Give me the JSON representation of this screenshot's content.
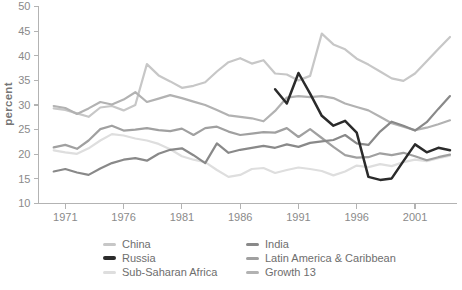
{
  "chart_data": {
    "type": "line",
    "title": "",
    "xlabel": "",
    "ylabel": "percent",
    "grid": false,
    "xlim": [
      1968.7,
      2004.6
    ],
    "ylim": [
      10,
      50
    ],
    "x_ticks": [
      1971,
      1976,
      1981,
      1986,
      1991,
      1996,
      2001
    ],
    "y_ticks": [
      10,
      15,
      20,
      25,
      30,
      35,
      40,
      45,
      50
    ],
    "years": [
      1970,
      1971,
      1972,
      1973,
      1974,
      1975,
      1976,
      1977,
      1978,
      1979,
      1980,
      1981,
      1982,
      1983,
      1984,
      1985,
      1986,
      1987,
      1988,
      1989,
      1990,
      1991,
      1992,
      1993,
      1994,
      1995,
      1996,
      1997,
      1998,
      1999,
      2000,
      2001,
      2002,
      2003,
      2004
    ],
    "series": [
      {
        "name": "Sub-Saharan Africa",
        "color": "#dedede",
        "values": [
          20.8,
          20.4,
          20.1,
          21.2,
          22.8,
          24.1,
          23.8,
          23.2,
          22.8,
          22.1,
          21.0,
          19.6,
          18.9,
          18.4,
          16.8,
          15.4,
          15.8,
          17.0,
          17.2,
          16.2,
          16.8,
          17.3,
          17.0,
          16.6,
          15.7,
          16.5,
          17.7,
          17.4,
          18.0,
          17.6,
          18.4,
          18.9,
          18.6,
          19.2,
          19.7
        ]
      },
      {
        "name": "China",
        "color": "#c7c7c7",
        "values": [
          29.3,
          29.0,
          28.3,
          27.6,
          29.5,
          29.8,
          28.9,
          30.0,
          38.3,
          36.0,
          34.8,
          33.5,
          33.9,
          34.6,
          36.8,
          38.7,
          39.5,
          38.4,
          39.1,
          36.4,
          36.2,
          35.0,
          35.9,
          44.5,
          42.3,
          41.3,
          39.4,
          38.2,
          36.8,
          35.4,
          34.9,
          36.4,
          38.9,
          41.4,
          43.8
        ]
      },
      {
        "name": "Growth 13",
        "color": "#b2b2b2",
        "values": [
          29.8,
          29.4,
          28.2,
          29.3,
          30.6,
          30.1,
          31.1,
          32.6,
          30.6,
          31.3,
          32.0,
          31.4,
          30.7,
          30.0,
          29.0,
          27.9,
          27.6,
          27.3,
          26.7,
          28.8,
          31.5,
          31.8,
          31.6,
          31.8,
          31.4,
          30.3,
          29.6,
          28.9,
          27.6,
          26.3,
          25.6,
          24.9,
          25.4,
          26.1,
          26.9
        ]
      },
      {
        "name": "Latin America & Caribbean",
        "color": "#a0a0a0",
        "values": [
          21.4,
          21.9,
          21.1,
          22.8,
          25.1,
          25.8,
          24.8,
          25.0,
          25.3,
          24.9,
          24.7,
          25.2,
          23.9,
          25.3,
          25.6,
          24.6,
          23.9,
          24.2,
          24.5,
          24.4,
          25.3,
          23.5,
          25.1,
          23.3,
          21.5,
          19.8,
          19.3,
          19.4,
          20.2,
          19.8,
          20.3,
          19.6,
          18.8,
          19.4,
          19.9
        ]
      },
      {
        "name": "India",
        "color": "#898989",
        "values": [
          16.5,
          17.0,
          16.3,
          15.8,
          17.1,
          18.2,
          18.9,
          19.2,
          18.7,
          20.1,
          20.9,
          21.2,
          19.8,
          18.2,
          22.2,
          20.3,
          20.9,
          21.3,
          21.7,
          21.3,
          22.0,
          21.5,
          22.3,
          22.6,
          22.9,
          23.9,
          22.2,
          21.9,
          24.6,
          26.6,
          25.8,
          24.8,
          26.5,
          29.2,
          31.8
        ]
      },
      {
        "name": "Russia",
        "color": "#2b2b2b",
        "values": [
          null,
          null,
          null,
          null,
          null,
          null,
          null,
          null,
          null,
          null,
          null,
          null,
          null,
          null,
          null,
          null,
          null,
          null,
          null,
          33.2,
          30.3,
          36.5,
          32.3,
          27.8,
          25.8,
          26.8,
          24.4,
          15.4,
          14.8,
          15.1,
          18.6,
          22.0,
          20.4,
          21.3,
          20.8
        ]
      }
    ],
    "legend_position": "bottom",
    "legend_columns": [
      [
        "China",
        "Russia",
        "Sub-Saharan Africa"
      ],
      [
        "India",
        "Latin America & Caribbean",
        "Growth 13"
      ]
    ]
  }
}
